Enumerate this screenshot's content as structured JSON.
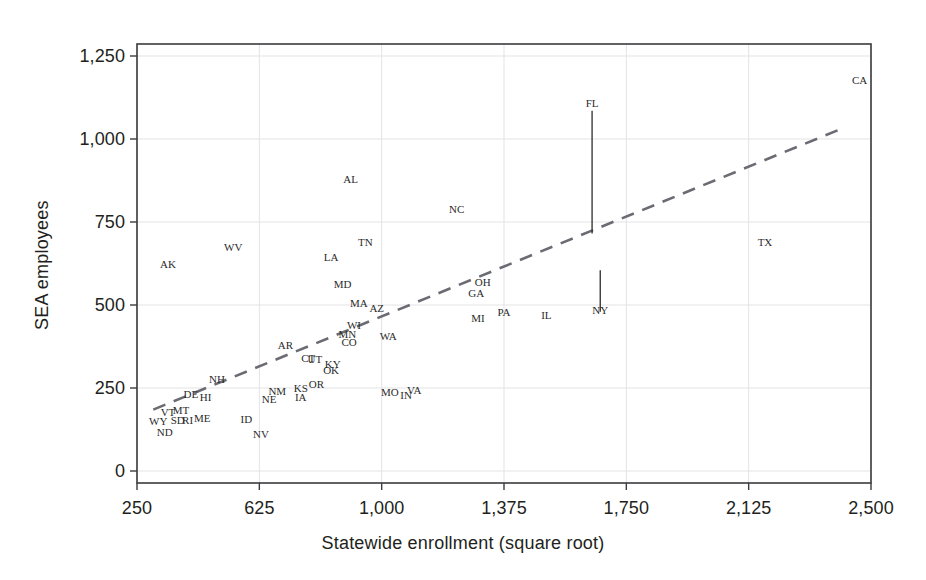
{
  "chart_data": {
    "type": "scatter",
    "title": "",
    "xlabel": "Statewide enrollment (square root)",
    "ylabel": "SEA employees",
    "xlim": [
      250,
      2500
    ],
    "ylim": [
      0,
      1250
    ],
    "xticks": [
      "250",
      "625",
      "1,000",
      "1,375",
      "1,750",
      "2,125",
      "2,500"
    ],
    "xtick_values": [
      250,
      625,
      1000,
      1375,
      1750,
      2125,
      2500
    ],
    "yticks": [
      "0",
      "250",
      "500",
      "750",
      "1,000",
      "1,250"
    ],
    "ytick_values": [
      0,
      250,
      500,
      750,
      1000,
      1250
    ],
    "grid": true,
    "legend": "none",
    "point_marker": "text-label",
    "trendline": {
      "style": "dashed",
      "color": "#6b6b73",
      "x_start": 300,
      "y_start": 185,
      "x_end": 2420,
      "y_end": 1035
    },
    "leader_lines": [
      {
        "label": "FL",
        "x": 1645,
        "y_label_top": 1085,
        "y_point": 715
      },
      {
        "label": "NY",
        "x": 1670,
        "y_point": 605,
        "y_label_bottom": 480
      }
    ],
    "points": [
      {
        "label": "CA",
        "x": 2465,
        "y": 1178
      },
      {
        "label": "FL",
        "x": 1645,
        "y": 715
      },
      {
        "label": "AL",
        "x": 905,
        "y": 880
      },
      {
        "label": "NC",
        "x": 1230,
        "y": 790
      },
      {
        "label": "TN",
        "x": 950,
        "y": 690
      },
      {
        "label": "WV",
        "x": 545,
        "y": 675
      },
      {
        "label": "AK",
        "x": 345,
        "y": 625
      },
      {
        "label": "LA",
        "x": 845,
        "y": 645
      },
      {
        "label": "TX",
        "x": 2175,
        "y": 690
      },
      {
        "label": "OH",
        "x": 1310,
        "y": 570
      },
      {
        "label": "MD",
        "x": 880,
        "y": 562
      },
      {
        "label": "GA",
        "x": 1290,
        "y": 535
      },
      {
        "label": "NY",
        "x": 1670,
        "y": 605
      },
      {
        "label": "MA",
        "x": 930,
        "y": 505
      },
      {
        "label": "AZ",
        "x": 985,
        "y": 492
      },
      {
        "label": "PA",
        "x": 1375,
        "y": 478
      },
      {
        "label": "IL",
        "x": 1505,
        "y": 470
      },
      {
        "label": "MI",
        "x": 1295,
        "y": 462
      },
      {
        "label": "WI",
        "x": 915,
        "y": 440
      },
      {
        "label": "MN",
        "x": 895,
        "y": 412
      },
      {
        "label": "WA",
        "x": 1020,
        "y": 408
      },
      {
        "label": "CO",
        "x": 900,
        "y": 390
      },
      {
        "label": "AR",
        "x": 705,
        "y": 380
      },
      {
        "label": "CT",
        "x": 775,
        "y": 340
      },
      {
        "label": "UT",
        "x": 795,
        "y": 338
      },
      {
        "label": "KY",
        "x": 850,
        "y": 322
      },
      {
        "label": "OK",
        "x": 845,
        "y": 305
      },
      {
        "label": "NH",
        "x": 495,
        "y": 278
      },
      {
        "label": "OR",
        "x": 800,
        "y": 262
      },
      {
        "label": "KS",
        "x": 752,
        "y": 250
      },
      {
        "label": "VA",
        "x": 1100,
        "y": 245
      },
      {
        "label": "NM",
        "x": 680,
        "y": 242
      },
      {
        "label": "MO",
        "x": 1025,
        "y": 238
      },
      {
        "label": "DE",
        "x": 415,
        "y": 232
      },
      {
        "label": "IN",
        "x": 1075,
        "y": 230
      },
      {
        "label": "HI",
        "x": 460,
        "y": 222
      },
      {
        "label": "IA",
        "x": 752,
        "y": 222
      },
      {
        "label": "NE",
        "x": 655,
        "y": 218
      },
      {
        "label": "MT",
        "x": 385,
        "y": 185
      },
      {
        "label": "VT",
        "x": 345,
        "y": 178
      },
      {
        "label": "ME",
        "x": 450,
        "y": 160
      },
      {
        "label": "ID",
        "x": 585,
        "y": 158
      },
      {
        "label": "SD",
        "x": 375,
        "y": 155
      },
      {
        "label": "RI",
        "x": 405,
        "y": 155
      },
      {
        "label": "WY",
        "x": 315,
        "y": 152
      },
      {
        "label": "NV",
        "x": 630,
        "y": 112
      },
      {
        "label": "ND",
        "x": 335,
        "y": 118
      }
    ]
  },
  "plot_frame": {
    "left_px": 137,
    "right_px": 871,
    "top_px": 44,
    "bottom_px": 483
  },
  "colors": {
    "frame": "#3b3b3f",
    "grid": "#e3e3e6",
    "text": "#231f20",
    "point_text": "#2b2b2b",
    "trendline": "#6b6b73",
    "leader": "#2b2b2b"
  }
}
